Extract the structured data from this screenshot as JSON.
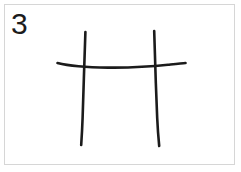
{
  "canvas": {
    "width": 241,
    "height": 172,
    "background_color": "#ffffff"
  },
  "frame": {
    "border_color": "#d6d6d6",
    "border_width": 1,
    "x": 4,
    "y": 4,
    "width": 231,
    "height": 161
  },
  "label": {
    "text": "3",
    "color": "#1c1c1c",
    "font_size_px": 30,
    "x": 11,
    "y": 9
  },
  "drawing": {
    "description": "hand-drawn H shape: two near-vertical strokes crossed by one long horizontal stroke",
    "stroke_color": "#1b1b1b",
    "stroke_width": 2.6,
    "strokes": [
      {
        "name": "vertical-stroke-left",
        "path": "M 85.4 32 C 84.6 56, 83.4 92, 82.6 118 C 82.2 130, 81.6 139, 81.2 145"
      },
      {
        "name": "vertical-stroke-right",
        "path": "M 154.2 31 C 154.8 55, 156.0 90, 157.2 118 C 157.8 131, 158.6 140, 159.2 146"
      },
      {
        "name": "horizontal-stroke",
        "path": "M 57.5 63.0 C 70 66.2, 88 67.4, 108 67.6 C 130 67.8, 152 66.6, 168 64.8 C 176 63.9, 182 63.2, 185.5 63.0"
      }
    ]
  }
}
